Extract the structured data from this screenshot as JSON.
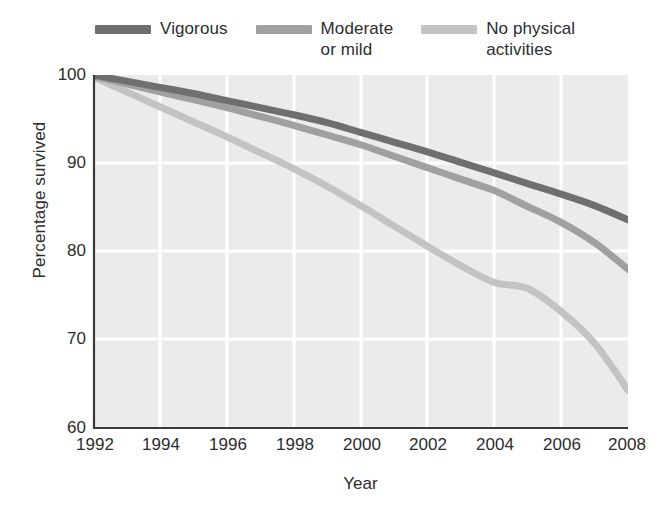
{
  "chart_data": {
    "type": "line",
    "title": "",
    "xlabel": "Year",
    "ylabel": "Percentage survived",
    "xlim": [
      1992,
      2008
    ],
    "ylim": [
      60,
      100
    ],
    "xticks": [
      "1992",
      "1994",
      "1996",
      "1998",
      "2000",
      "2002",
      "2004",
      "2006",
      "2008"
    ],
    "yticks": [
      "60",
      "70",
      "80",
      "90",
      "100"
    ],
    "grid": true,
    "legend_position": "top",
    "x": [
      1992,
      1993,
      1994,
      1995,
      1996,
      1997,
      1998,
      1999,
      2000,
      2001,
      2002,
      2003,
      2004,
      2005,
      2006,
      2007,
      2008
    ],
    "series": [
      {
        "name": "Vigorous",
        "color": "#6f6f6f",
        "values": [
          100.0,
          99.3,
          98.6,
          97.9,
          97.1,
          96.3,
          95.5,
          94.6,
          93.5,
          92.4,
          91.3,
          90.1,
          88.9,
          87.7,
          86.5,
          85.2,
          83.6
        ]
      },
      {
        "name": "Moderate\nor mild",
        "color": "#a0a0a0",
        "values": [
          99.9,
          99.0,
          98.1,
          97.2,
          96.3,
          95.3,
          94.3,
          93.2,
          92.1,
          90.8,
          89.5,
          88.2,
          86.9,
          85.1,
          83.3,
          81.0,
          78.0
        ]
      },
      {
        "name": "No physical\nactivities",
        "color": "#c3c3c3",
        "values": [
          99.8,
          98.1,
          96.4,
          94.7,
          93.0,
          91.2,
          89.4,
          87.4,
          85.2,
          82.9,
          80.6,
          78.4,
          76.5,
          75.8,
          73.2,
          69.6,
          64.3
        ]
      }
    ]
  },
  "legend": {
    "items": [
      {
        "label": "Vigorous",
        "color": "#6f6f6f"
      },
      {
        "label": "Moderate\nor mild",
        "color": "#a0a0a0"
      },
      {
        "label": "No physical\nactivities",
        "color": "#c3c3c3"
      }
    ]
  },
  "axes": {
    "x_title": "Year",
    "y_title": "Percentage survived",
    "x_tick_labels": [
      "1992",
      "1994",
      "1996",
      "1998",
      "2000",
      "2002",
      "2004",
      "2006",
      "2008"
    ],
    "y_tick_labels": [
      "100",
      "90",
      "80",
      "70",
      "60"
    ]
  },
  "colors": {
    "plot_background": "#ebebeb",
    "gridline": "#ffffff",
    "axis_line": "#3a3a3a",
    "text": "#2d2d2d"
  }
}
